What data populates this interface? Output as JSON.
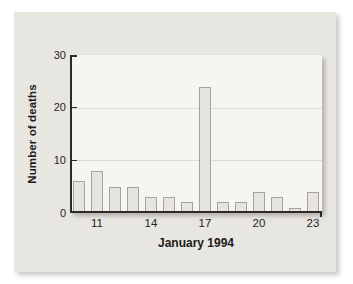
{
  "figure": {
    "y_axis_title": "Number of deaths",
    "x_axis_title": "January 1994"
  },
  "chart_data": {
    "type": "bar",
    "title": "",
    "xlabel": "January 1994",
    "ylabel": "Number of deaths",
    "x": [
      10,
      11,
      12,
      13,
      14,
      15,
      16,
      17,
      18,
      19,
      20,
      21,
      22,
      23
    ],
    "values": [
      6,
      8,
      5,
      5,
      3,
      3,
      2,
      24,
      2,
      2,
      4,
      3,
      1,
      4
    ],
    "ylim": [
      0,
      30
    ],
    "yticks": [
      0,
      10,
      20,
      30
    ],
    "xticks": [
      11,
      14,
      17,
      20,
      23
    ],
    "grid": "faint horizontal gridlines at 10 and 20",
    "gridlines_at": [
      10,
      20
    ],
    "legend_position": "none",
    "colors": {
      "panel_background": "#e8e6e1",
      "plot_background": "#f6f5f2",
      "bar_fill": "#e6e4df",
      "bar_border": "#a5a29b",
      "axis": "#2b2a28",
      "gridline": "#dcdad4",
      "text": "#1d1c1a"
    }
  }
}
